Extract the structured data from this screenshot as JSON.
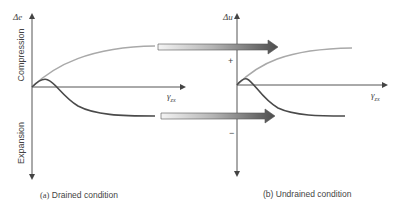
{
  "panel_a": {
    "y_axis_label": "Δe",
    "x_axis_label": "γ",
    "x_axis_subscript": "zx",
    "upper_region_label": "Compression",
    "lower_region_label": "Expansion",
    "caption_letter": "(a)",
    "caption_text": " Drained condition",
    "curves": [
      {
        "name": "loose-soil-compression",
        "color": "#a9a9a9"
      },
      {
        "name": "dense-soil-dilation",
        "color": "#4a4a4a"
      }
    ]
  },
  "panel_b": {
    "y_axis_label": "Δu",
    "x_axis_label": "γ",
    "x_axis_subscript": "zx",
    "positive_sign": "+",
    "negative_sign": "−",
    "caption_letter": "(b)",
    "caption_text": " Undrained condition",
    "curves": [
      {
        "name": "positive-pore-pressure",
        "color": "#a9a9a9"
      },
      {
        "name": "negative-pore-pressure",
        "color": "#4a4a4a"
      }
    ]
  },
  "arrows": [
    {
      "name": "compression-to-positive-arrow",
      "from": "panel_a",
      "to": "panel_b"
    },
    {
      "name": "expansion-to-negative-arrow",
      "from": "panel_a",
      "to": "panel_b"
    }
  ],
  "colors": {
    "axis": "#555555",
    "light_curve": "#a9a9a9",
    "dark_curve": "#4a4a4a",
    "arrow_start": "#f2f2f2",
    "arrow_end": "#4d4d4d"
  }
}
